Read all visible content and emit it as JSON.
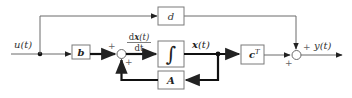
{
  "diagram": {
    "input_label": "u(t)",
    "output_label": "y(t)",
    "blocks": {
      "b": {
        "label": "b",
        "bold": true
      },
      "d": {
        "label": "d",
        "bold": false
      },
      "integrator": {
        "label": "∫"
      },
      "A": {
        "label": "A",
        "bold": true
      },
      "cT": {
        "label": "c",
        "superscript": "T",
        "bold": true
      }
    },
    "derivative_label": {
      "numerator": "dx(t)",
      "numerator_prefix": "d",
      "numerator_var": "x",
      "numerator_suffix": "(t)",
      "denominator": "dt"
    },
    "state_label": {
      "var": "x",
      "suffix": "(t)"
    },
    "summer_left": {
      "sign_top": "+",
      "sign_bottom": "+"
    },
    "summer_right": {
      "sign_top": "+",
      "sign_bottom": "+"
    },
    "colors": {
      "wire": "#6a6a6a",
      "bold_wire": "#111111",
      "box_border": "#7a7a7a"
    }
  }
}
